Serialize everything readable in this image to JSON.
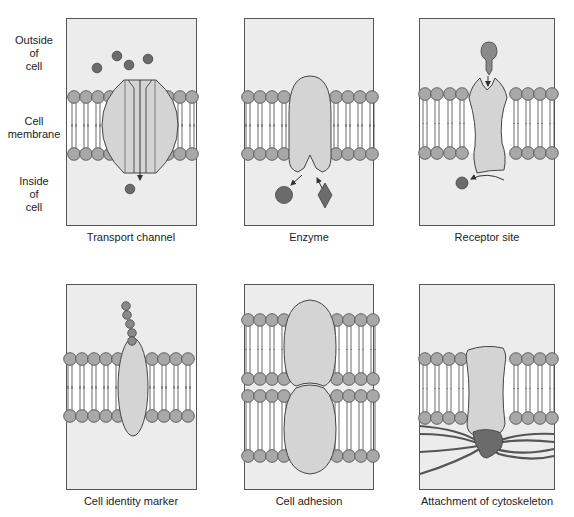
{
  "side_labels": {
    "outside": [
      "Outside",
      "of",
      "cell"
    ],
    "membrane": [
      "Cell",
      "membrane"
    ],
    "inside": [
      "Inside",
      "of",
      "cell"
    ]
  },
  "panels": [
    {
      "id": "transport-channel",
      "caption": "Transport channel"
    },
    {
      "id": "enzyme",
      "caption": "Enzyme"
    },
    {
      "id": "receptor-site",
      "caption": "Receptor site"
    },
    {
      "id": "cell-identity-marker",
      "caption": "Cell identity marker"
    },
    {
      "id": "cell-adhesion",
      "caption": "Cell adhesion"
    },
    {
      "id": "attachment-of-cytoskeleton",
      "caption": "Attachment of cytoskeleton"
    }
  ],
  "colors": {
    "panel_bg": "#ececec",
    "panel_border": "#555555",
    "lipid_head": "#a8a8a8",
    "protein": "#d4d4d4",
    "molecule_dark": "#6b6b6b",
    "membrane_core": "#ffffff"
  }
}
